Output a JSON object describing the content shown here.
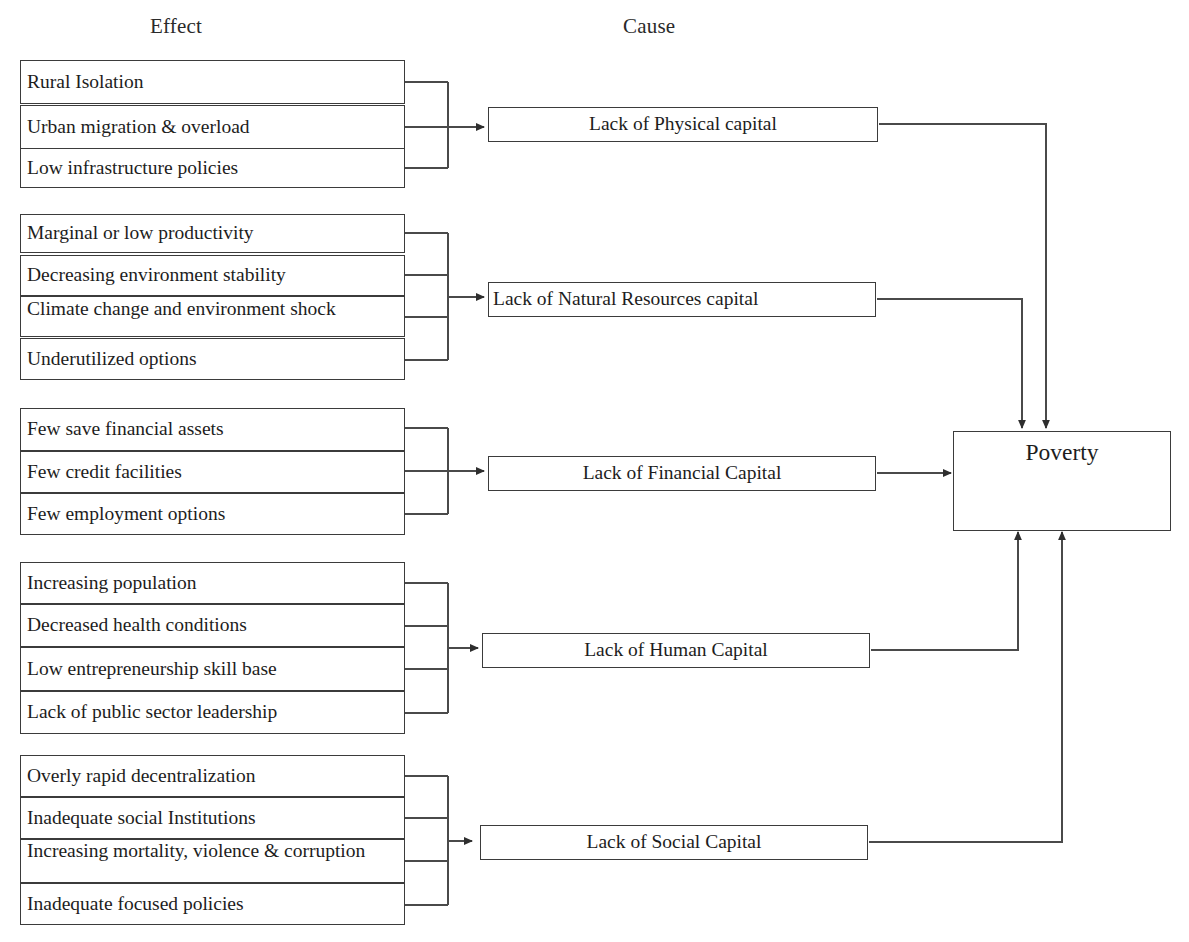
{
  "headers": {
    "effect": "Effect",
    "cause": "Cause"
  },
  "outcome": {
    "label": "Poverty"
  },
  "groups": [
    {
      "cause": "Lack of Physical capital",
      "effects": [
        "Rural Isolation",
        "Urban migration & overload",
        "Low infrastructure policies"
      ]
    },
    {
      "cause": "Lack of Natural Resources capital",
      "effects": [
        "Marginal or low productivity",
        "Decreasing environment stability",
        "Climate change and environment shock",
        "Underutilized options"
      ]
    },
    {
      "cause": "Lack of Financial Capital",
      "effects": [
        "Few save financial assets",
        "Few credit facilities",
        "Few employment options"
      ]
    },
    {
      "cause": "Lack of Human Capital",
      "effects": [
        "Increasing population",
        "Decreased health conditions",
        "Low entrepreneurship skill base",
        "Lack of public sector leadership"
      ]
    },
    {
      "cause": "Lack of Social Capital",
      "effects": [
        "Overly rapid decentralization",
        "Inadequate social Institutions",
        "Increasing mortality, violence & corruption",
        "Inadequate focused policies"
      ]
    }
  ],
  "colors": {
    "stroke": "#3b3b3b",
    "text": "#1d1d1d",
    "background": "#ffffff"
  }
}
